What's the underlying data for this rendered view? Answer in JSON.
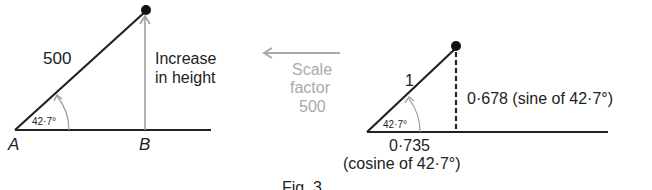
{
  "left_triangle": {
    "hypotenuse_label": "500",
    "angle_label": "42·7°",
    "vertical_label_line1": "Increase",
    "vertical_label_line2": "in height",
    "point_a": "A",
    "point_b": "B"
  },
  "arrow": {
    "line1": "Scale",
    "line2": "factor",
    "line3": "500",
    "color": "#aaaaaa"
  },
  "right_triangle": {
    "hypotenuse_label": "1",
    "angle_label": "42·7°",
    "vertical_label": "0·678 (sine of 42·7°)",
    "base_label": "0·735",
    "base_sublabel": "(cosine of 42·7°)"
  },
  "caption": "Fig. 3"
}
